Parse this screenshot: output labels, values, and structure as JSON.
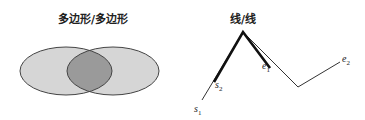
{
  "left_panel": {
    "title": "多边形/多边形",
    "shapes": [
      {
        "name": "polygon-a",
        "cx": 66,
        "cy": 71,
        "rx": 46,
        "ry": 24
      },
      {
        "name": "polygon-b",
        "cx": 113,
        "cy": 71,
        "rx": 46,
        "ry": 24
      }
    ],
    "colors": {
      "fill": "#d6d6d6",
      "overlap": "#9a9a9a",
      "stroke": "#444444"
    }
  },
  "right_panel": {
    "title": "线/线",
    "labels": {
      "s1": {
        "base": "s",
        "sub": "1"
      },
      "s2": {
        "base": "s",
        "sub": "2"
      },
      "e1": {
        "base": "e",
        "sub": "1"
      },
      "e2": {
        "base": "e",
        "sub": "2"
      }
    },
    "points": {
      "s1": [
        202,
        100
      ],
      "s2": [
        214,
        82
      ],
      "peak": [
        243,
        32
      ],
      "e1": [
        270,
        68
      ],
      "valley": [
        298,
        87
      ],
      "e2": [
        340,
        62
      ]
    }
  }
}
